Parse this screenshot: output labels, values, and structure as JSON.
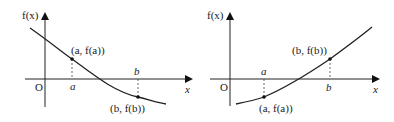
{
  "graphs": [
    {
      "id": "left",
      "y_axis_label": "f(x)",
      "x_axis_label": "x",
      "origin_label": "O",
      "point_a_label": "(a, f(a))",
      "point_b_label": "(b, f(b))",
      "tick_a": "a",
      "tick_b": "b",
      "curve": "decreasing, crosses x-axis between a and b"
    },
    {
      "id": "right",
      "y_axis_label": "f(x)",
      "x_axis_label": "x",
      "origin_label": "O",
      "point_a_label": "(a, f(a))",
      "point_b_label": "(b, f(b))",
      "tick_a": "a",
      "tick_b": "b",
      "curve": "increasing, crosses x-axis between a and b"
    }
  ],
  "colors": {
    "line": "#222222",
    "dashed": "#444444"
  }
}
